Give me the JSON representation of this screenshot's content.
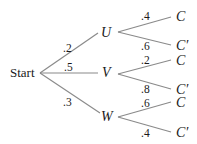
{
  "diagram": {
    "type": "probability-tree",
    "root": {
      "label": "Start"
    },
    "level1": [
      {
        "id": "U",
        "label": "U",
        "prob": ".2"
      },
      {
        "id": "V",
        "label": "V",
        "prob": ".5"
      },
      {
        "id": "W",
        "label": "W",
        "prob": ".3"
      }
    ],
    "level2": {
      "U": [
        {
          "label": "C",
          "prob": ".4"
        },
        {
          "label": "C′",
          "prob": ".6"
        }
      ],
      "V": [
        {
          "label": "C",
          "prob": ".2"
        },
        {
          "label": "C′",
          "prob": ".8"
        }
      ],
      "W": [
        {
          "label": "C",
          "prob": ".6"
        },
        {
          "label": "C′",
          "prob": ".4"
        }
      ]
    },
    "colors": {
      "edge": "#8a8a8a",
      "text": "#1a1a1a",
      "background": "#ffffff"
    }
  }
}
